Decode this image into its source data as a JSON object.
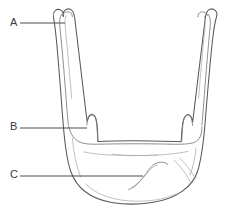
{
  "figure": {
    "kind": "anatomical-line-drawing",
    "background_color": "#ffffff",
    "outline_color": "#58585a",
    "detail_color": "#7b7b7e",
    "leader_color": "#4c4c4e",
    "label_color": "#3b3b3d",
    "width": 226,
    "height": 211
  },
  "labels": [
    {
      "id": "a",
      "text": "A",
      "label_x": 10,
      "label_y": 17,
      "leader": {
        "x1": 20,
        "y1": 23,
        "x2": 65,
        "y2": 23
      },
      "target": "left-greater-horn-tip"
    },
    {
      "id": "b",
      "text": "B",
      "label_x": 10,
      "label_y": 121,
      "leader": {
        "x1": 20,
        "y1": 128,
        "x2": 87,
        "y2": 128
      },
      "target": "left-lesser-horn"
    },
    {
      "id": "c",
      "text": "C",
      "label_x": 10,
      "label_y": 169,
      "leader": {
        "x1": 20,
        "y1": 176,
        "x2": 143,
        "y2": 176
      },
      "target": "body-of-hyoid"
    }
  ]
}
